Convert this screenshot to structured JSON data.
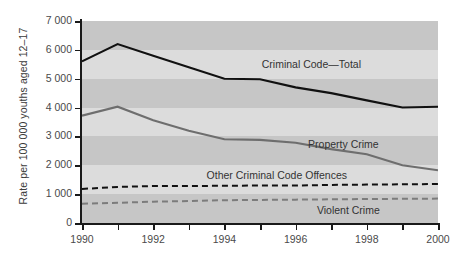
{
  "chart_data": {
    "type": "line",
    "title": "",
    "xlabel": "",
    "ylabel": "Rate per 100 000 youths aged 12–17",
    "x": [
      1990,
      1991,
      1992,
      1993,
      1994,
      1995,
      1996,
      1997,
      1998,
      1999,
      2000
    ],
    "xlim": [
      1990,
      2000
    ],
    "ylim": [
      0,
      7000
    ],
    "xticklabels": [
      "1990",
      "1992",
      "1994",
      "1996",
      "1998",
      "2000"
    ],
    "xticks": [
      1990,
      1992,
      1994,
      1996,
      1998,
      2000
    ],
    "xminorticks": [
      1991,
      1993,
      1995,
      1997,
      1999
    ],
    "yticks": [
      0,
      1000,
      2000,
      3000,
      4000,
      5000,
      6000,
      7000
    ],
    "yticklabels": [
      "0",
      "1 000",
      "2 000",
      "3 000",
      "4 000",
      "5 000",
      "6 000",
      "7 000"
    ],
    "grid": false,
    "banded_background": true,
    "legend_position": "inline-labels",
    "series": [
      {
        "name": "Criminal Code—Total",
        "style": "solid",
        "color": "#111111",
        "values": [
          5600,
          6200,
          5800,
          5400,
          5000,
          4980,
          4700,
          4500,
          4250,
          4000,
          4030
        ]
      },
      {
        "name": "Property Crime",
        "style": "solid",
        "color": "#6e6e6e",
        "values": [
          3720,
          4030,
          3560,
          3200,
          2900,
          2880,
          2780,
          2560,
          2380,
          2000,
          1830
        ]
      },
      {
        "name": "Other Criminal Code Offences",
        "style": "dashed",
        "color": "#111111",
        "values": [
          1180,
          1250,
          1280,
          1280,
          1290,
          1300,
          1300,
          1320,
          1330,
          1340,
          1350
        ]
      },
      {
        "name": "Violent Crime",
        "style": "dashed",
        "color": "#7c7c7c",
        "values": [
          670,
          700,
          740,
          760,
          790,
          800,
          810,
          820,
          830,
          840,
          845
        ]
      }
    ],
    "annotations": [
      {
        "text": "Criminal Code—Total",
        "x": 1995.05,
        "y": 5480
      },
      {
        "text": "Property Crime",
        "x": 1996.35,
        "y": 2700
      },
      {
        "text": "Other Criminal Code Offences",
        "x": 1993.5,
        "y": 1620
      },
      {
        "text": "Violent Crime",
        "x": 1996.6,
        "y": 430
      }
    ]
  },
  "colors": {
    "band_dark": "#c6c6c6",
    "band_light": "#dcdcdc",
    "axis": "#1a1a1a",
    "tick_label": "#4a4a4a",
    "annotation": "#333333"
  }
}
